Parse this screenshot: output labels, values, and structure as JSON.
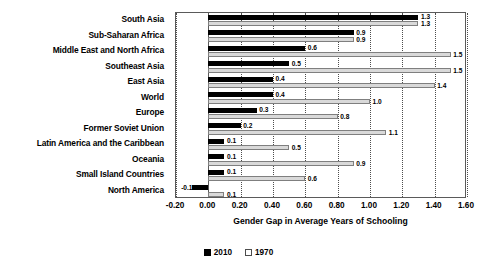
{
  "chart_data": {
    "type": "bar",
    "orientation": "horizontal",
    "title": "",
    "xlabel": "Gender Gap in Average Years of Schooling",
    "ylabel": "",
    "xlim": [
      -0.2,
      1.6
    ],
    "xticks": [
      "-0.20",
      "0.00",
      "0.20",
      "0.40",
      "0.60",
      "0.80",
      "1.00",
      "1.20",
      "1.40",
      "1.60"
    ],
    "xtick_values": [
      -0.2,
      0.0,
      0.2,
      0.4,
      0.6,
      0.8,
      1.0,
      1.2,
      1.4,
      1.6
    ],
    "grid": true,
    "legend_position": "bottom",
    "categories": [
      "South Asia",
      "Sub-Saharan Africa",
      "Middle East and North Africa",
      "Southeast Asia",
      "East Asia",
      "World",
      "Europe",
      "Former Soviet Union",
      "Latin America and the Caribbean",
      "Oceania",
      "Small Island Countries",
      "North America"
    ],
    "series": [
      {
        "name": "2010",
        "color": "#000000",
        "values": [
          1.3,
          0.9,
          0.6,
          0.5,
          0.4,
          0.4,
          0.3,
          0.2,
          0.1,
          0.1,
          0.1,
          -0.1
        ],
        "labels": [
          "1.3",
          "0.9",
          "0.6",
          "0.5",
          "0.4",
          "0.4",
          "0.3",
          "0.2",
          "0.1",
          "0.1",
          "0.1",
          "-0.1"
        ]
      },
      {
        "name": "1970",
        "color": "#d9d9d9",
        "values": [
          1.3,
          0.9,
          1.5,
          1.5,
          1.4,
          1.0,
          0.8,
          1.1,
          0.5,
          0.9,
          0.6,
          0.1
        ],
        "labels": [
          "1.3",
          "0.9",
          "1.5",
          "1.5",
          "1.4",
          "1.0",
          "0.8",
          "1.1",
          "0.5",
          "0.9",
          "0.6",
          "0.1"
        ]
      }
    ]
  },
  "legend": {
    "items": [
      {
        "label": "2010",
        "swatch": "filled-black-square-icon"
      },
      {
        "label": "1970",
        "swatch": "outlined-white-square-icon"
      }
    ]
  }
}
